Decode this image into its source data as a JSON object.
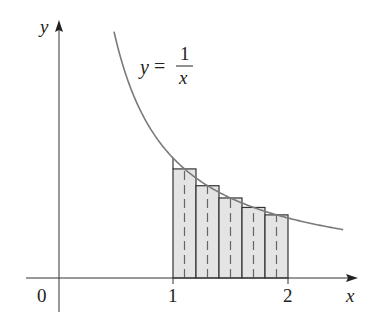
{
  "diagram": {
    "type": "midpoint-rule-approximation",
    "function_label": {
      "lhs": "y",
      "eq": "=",
      "numerator": "1",
      "denominator": "x"
    },
    "axes": {
      "x_label": "x",
      "y_label": "y",
      "origin_label": "0",
      "x_ticks": [
        {
          "value": 1,
          "label": "1"
        },
        {
          "value": 2,
          "label": "2"
        }
      ]
    },
    "interval": [
      1,
      2
    ],
    "n_rectangles": 5,
    "rectangles": [
      {
        "left": 1.0,
        "right": 1.2,
        "midpoint": 1.1,
        "height": 0.909
      },
      {
        "left": 1.2,
        "right": 1.4,
        "midpoint": 1.3,
        "height": 0.769
      },
      {
        "left": 1.4,
        "right": 1.6,
        "midpoint": 1.5,
        "height": 0.667
      },
      {
        "left": 1.6,
        "right": 1.8,
        "midpoint": 1.7,
        "height": 0.588
      },
      {
        "left": 1.8,
        "right": 2.0,
        "midpoint": 1.9,
        "height": 0.526
      }
    ],
    "curve_domain": [
      0.487,
      2.48
    ],
    "colors": {
      "curve": "#7a7a7a",
      "rect_fill": "#e4e4e4",
      "rect_stroke": "#333333",
      "midline": "#666666",
      "axis": "#333333"
    }
  }
}
